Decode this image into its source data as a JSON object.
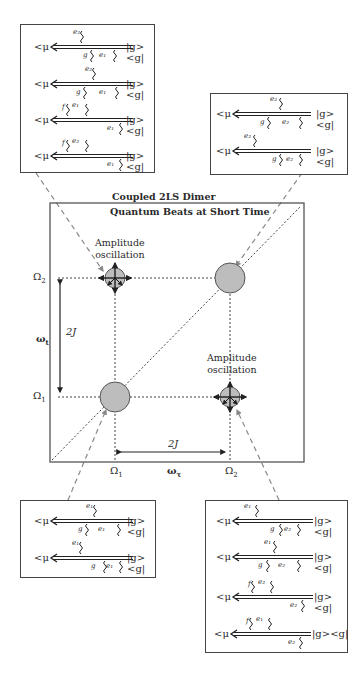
{
  "figure": {
    "title_line1": "Coupled 2LS Dimer",
    "title_line2": "Quantum Beats at Short Time",
    "amplitude_label_line1": "Amplitude",
    "amplitude_label_line2": "oscillation",
    "axis": {
      "x_label": "ωτ",
      "y_label": "ωt",
      "x_ticks": [
        "Ω1",
        "Ω2"
      ],
      "y_ticks": [
        "Ω1",
        "Ω2"
      ],
      "splitting_label_x": "2J",
      "splitting_label_y": "2J"
    },
    "peaks": [
      {
        "name": "diagonal-Ω1",
        "x": "Ω1",
        "y": "Ω1",
        "type": "diagonal"
      },
      {
        "name": "diagonal-Ω2",
        "x": "Ω2",
        "y": "Ω2",
        "type": "diagonal"
      },
      {
        "name": "cross-upper-left",
        "x": "Ω1",
        "y": "Ω2",
        "type": "cross",
        "oscillating": true
      },
      {
        "name": "cross-lower-right",
        "x": "Ω2",
        "y": "Ω1",
        "type": "cross",
        "oscillating": true
      }
    ]
  },
  "common": {
    "mu": "<μ",
    "ket": "|g><g|"
  },
  "boxes": {
    "top_left": {
      "diagrams": [
        {
          "top": [
            "e2"
          ],
          "bottom": [
            "g",
            "e1"
          ]
        },
        {
          "top": [
            "e2"
          ],
          "bottom": [
            "g",
            "e1"
          ]
        },
        {
          "top": [
            "f",
            "e1"
          ],
          "bottom": [
            "e1"
          ]
        },
        {
          "top": [
            "f",
            "e2"
          ],
          "bottom": [
            "e1"
          ]
        }
      ]
    },
    "top_right": {
      "diagrams": [
        {
          "top": [
            "e2"
          ],
          "bottom": [
            "g",
            "e2"
          ]
        },
        {
          "top": [
            "e2"
          ],
          "bottom": [
            "g",
            "e2"
          ]
        }
      ]
    },
    "bottom_left": {
      "diagrams": [
        {
          "top": [
            "e1"
          ],
          "bottom": [
            "g",
            "e1"
          ]
        },
        {
          "top": [
            "e1"
          ],
          "bottom": [
            "g",
            "e1"
          ]
        }
      ]
    },
    "bottom_right": {
      "diagrams": [
        {
          "top": [
            "e1"
          ],
          "bottom": [
            "g",
            "e2"
          ]
        },
        {
          "top": [
            "e1"
          ],
          "bottom": [
            "g",
            "e2"
          ]
        },
        {
          "top": [
            "f",
            "e2"
          ],
          "bottom": [
            "e2"
          ]
        },
        {
          "top": [
            "f",
            "e1"
          ],
          "bottom": [
            "e2"
          ]
        }
      ]
    }
  },
  "labels": {
    "tl": [
      {
        "top": "e₂",
        "b1": "g",
        "b2": "e₁"
      },
      {
        "top": "e₂",
        "b1": "g",
        "b2": "e₁"
      },
      {
        "top1": "f",
        "top2": "e₁",
        "bot": "e₁"
      },
      {
        "top1": "f",
        "top2": "e₂",
        "bot": "e₁"
      }
    ],
    "tr": [
      {
        "top": "e₂",
        "b1": "g",
        "b2": "e₂"
      },
      {
        "top": "e₂",
        "b1": "g",
        "b2": "e₂"
      }
    ],
    "bl": [
      {
        "top": "e₁",
        "b1": "g",
        "b2": "e₁"
      },
      {
        "top": "e₁",
        "b1": "g",
        "b2": "e₁"
      }
    ],
    "br": [
      {
        "top": "e₁",
        "b1": "g",
        "b2": "e₂"
      },
      {
        "top": "e₁",
        "b1": "g",
        "b2": "e₂"
      },
      {
        "top1": "f",
        "top2": "e₂",
        "bot": "e₂"
      },
      {
        "top1": "f",
        "top2": "e₁",
        "bot": "e₂"
      }
    ]
  },
  "ticks": {
    "omega1": "Ω",
    "omega2": "Ω",
    "sub1": "1",
    "sub2": "2",
    "wt": "ω",
    "wt_sub": "t",
    "wtau": "ω",
    "wtau_sub": "τ"
  }
}
